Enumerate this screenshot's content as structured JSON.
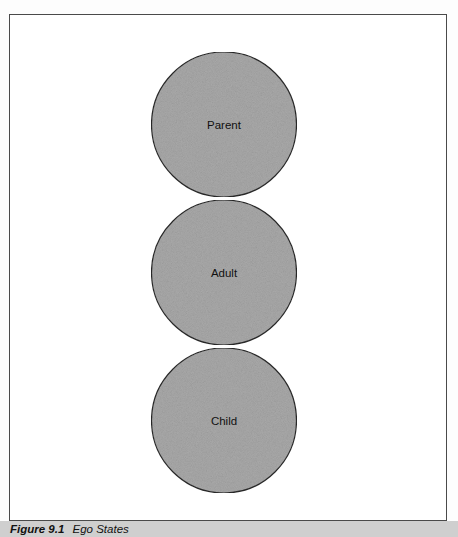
{
  "figure": {
    "number_label": "Figure 9.1",
    "title": "Ego States"
  },
  "diagram": {
    "type": "stacked-circles",
    "fill_color": "#a9a9a9",
    "stroke_color": "#2a2a2a",
    "nodes": [
      {
        "id": "parent",
        "label": "Parent"
      },
      {
        "id": "adult",
        "label": "Adult"
      },
      {
        "id": "child",
        "label": "Child"
      }
    ]
  }
}
